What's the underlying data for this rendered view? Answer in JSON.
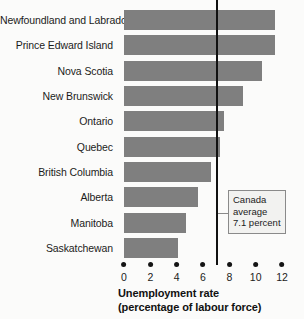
{
  "chart_data": {
    "type": "bar",
    "orientation": "horizontal",
    "title": "",
    "xlabel": "Unemployment rate (percentage of labour force)",
    "ylabel": "",
    "xlim": [
      0,
      12
    ],
    "xticks": [
      0,
      2,
      4,
      6,
      8,
      10,
      12
    ],
    "xtick_labels": [
      "0",
      "2",
      "4",
      "6",
      "8",
      "10",
      "12"
    ],
    "grid": false,
    "legend": false,
    "categories": [
      "Newfoundland and Labrador",
      "Prince Edward Island",
      "Nova Scotia",
      "New Brunswick",
      "Ontario",
      "Quebec",
      "British Columbia",
      "Alberta",
      "Manitoba",
      "Saskatchewan"
    ],
    "values": [
      11.5,
      11.5,
      10.5,
      9.0,
      7.6,
      7.3,
      6.6,
      5.6,
      4.7,
      4.1
    ],
    "bar_color": "#7f7f7f",
    "reference_line": {
      "value": 7.1,
      "color": "#111111",
      "annotation_lines": [
        "Canada",
        "average",
        "7.1 percent"
      ]
    }
  },
  "axis_title": {
    "line1": "Unemployment rate",
    "line2": "(percentage of labour force)"
  }
}
